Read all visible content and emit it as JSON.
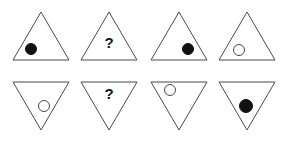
{
  "figure": {
    "background_color": "#ffffff",
    "stroke_color": "#4a4a4a",
    "filled_color": "#111111",
    "open_fill_color": "#ffffff",
    "question_label": "?",
    "rows": 2,
    "columns": 4,
    "grid_width": 286,
    "grid_height": 142
  },
  "cells": [
    {
      "index": 1,
      "row": 1,
      "column": 1,
      "orientation": "up",
      "content": "filled-circle",
      "content_label": "",
      "content_position": "bottom-left",
      "x": 8,
      "y": 6,
      "mark_cx": 23,
      "mark_cy": 43,
      "mark_r": 6
    },
    {
      "index": 2,
      "row": 1,
      "column": 2,
      "orientation": "up",
      "content": "question",
      "content_label": "?",
      "content_position": "center",
      "x": 76,
      "y": 6,
      "mark_cx": 33,
      "mark_cy": 37,
      "mark_r": 0
    },
    {
      "index": 3,
      "row": 1,
      "column": 3,
      "orientation": "up",
      "content": "filled-circle",
      "content_label": "",
      "content_position": "bottom-right",
      "x": 146,
      "y": 6,
      "mark_cx": 42,
      "mark_cy": 43,
      "mark_r": 6
    },
    {
      "index": 4,
      "row": 1,
      "column": 4,
      "orientation": "up",
      "content": "open-circle",
      "content_label": "",
      "content_position": "bottom-left",
      "x": 214,
      "y": 6,
      "mark_cx": 25,
      "mark_cy": 44,
      "mark_r": 6
    },
    {
      "index": 5,
      "row": 2,
      "column": 1,
      "orientation": "down",
      "content": "open-circle",
      "content_label": "",
      "content_position": "bottom-center",
      "x": 8,
      "y": 76,
      "mark_cx": 36,
      "mark_cy": 30,
      "mark_r": 6
    },
    {
      "index": 6,
      "row": 2,
      "column": 2,
      "orientation": "down",
      "content": "question",
      "content_label": "?",
      "content_position": "top-center",
      "x": 76,
      "y": 76,
      "mark_cx": 33,
      "mark_cy": 18,
      "mark_r": 0
    },
    {
      "index": 7,
      "row": 2,
      "column": 3,
      "orientation": "down",
      "content": "open-circle",
      "content_label": "",
      "content_position": "top-left",
      "x": 146,
      "y": 76,
      "mark_cx": 24,
      "mark_cy": 14,
      "mark_r": 6
    },
    {
      "index": 8,
      "row": 2,
      "column": 4,
      "orientation": "down",
      "content": "filled-circle",
      "content_label": "",
      "content_position": "center",
      "x": 214,
      "y": 76,
      "mark_cx": 32,
      "mark_cy": 30,
      "mark_r": 7
    }
  ]
}
